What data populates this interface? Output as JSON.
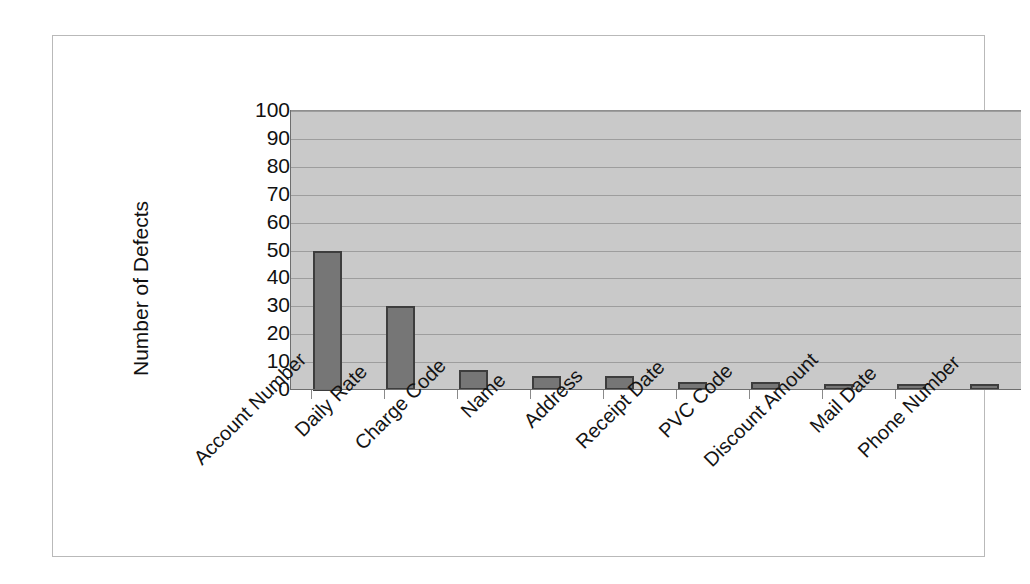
{
  "chart_data": {
    "type": "bar",
    "title": "",
    "subtitle": "",
    "xlabel": "",
    "ylabel": "Number of Defects",
    "ylim": [
      0,
      100
    ],
    "ytick_step": 10,
    "yticks": [
      100,
      90,
      80,
      70,
      60,
      50,
      40,
      30,
      20,
      10,
      0
    ],
    "grid": true,
    "legend": "none",
    "categories": [
      "Account Number",
      "Daily Rate",
      "Charge Code",
      "Name",
      "Address",
      "Receipt Date",
      "PVC Code",
      "Discount Amount",
      "Mail Date",
      "Phone Number"
    ],
    "values": [
      50,
      30,
      7,
      5,
      5,
      3,
      3,
      2,
      2,
      2
    ],
    "series": [
      {
        "name": "Number of Defects",
        "values": [
          50,
          30,
          7,
          5,
          5,
          3,
          3,
          2,
          2,
          2
        ]
      }
    ]
  },
  "style": {
    "bar_fill": "#767676",
    "bar_border": "#3d3d3d",
    "plot_background": "#c9c9c9",
    "gridline_color": "#9d9d9d",
    "axis_color": "#6e6e6e",
    "frame_border": "#b9b9b9",
    "text_color": "#111111"
  }
}
